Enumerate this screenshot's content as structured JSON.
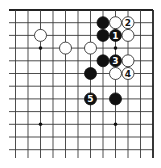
{
  "diagram": {
    "type": "go-board-fragment",
    "corner": "top-right",
    "grid": {
      "columns": 12,
      "rows": 12,
      "right_edge_x": 153,
      "top_edge_y": 10,
      "spacing_x": 12.5,
      "spacing_y": 12.7,
      "left_line_start_x": 9,
      "bottom_line_end_y": 158
    },
    "colors": {
      "line": "#3a3a3a",
      "edge": "#222222",
      "black_stone": "#111111",
      "white_stone": "#ffffff",
      "white_outline": "#333333"
    },
    "star_points": [
      {
        "col": 3,
        "row": 3
      },
      {
        "col": 9,
        "row": 3
      },
      {
        "col": 3,
        "row": 9
      },
      {
        "col": 9,
        "row": 9
      }
    ],
    "stones": [
      {
        "color": "black",
        "col": 4,
        "row": 1,
        "label": ""
      },
      {
        "color": "white",
        "col": 3,
        "row": 1,
        "label": ""
      },
      {
        "color": "white",
        "col": 2,
        "row": 1,
        "label": "2"
      },
      {
        "color": "black",
        "col": 4,
        "row": 2,
        "label": ""
      },
      {
        "color": "black",
        "col": 3,
        "row": 2,
        "label": "1"
      },
      {
        "color": "white",
        "col": 2,
        "row": 2,
        "label": ""
      },
      {
        "color": "white",
        "col": 9,
        "row": 2,
        "label": ""
      },
      {
        "color": "white",
        "col": 7,
        "row": 3,
        "label": ""
      },
      {
        "color": "white",
        "col": 5,
        "row": 3,
        "label": ""
      },
      {
        "color": "black",
        "col": 4,
        "row": 4,
        "label": ""
      },
      {
        "color": "black",
        "col": 3,
        "row": 4,
        "label": "3"
      },
      {
        "color": "white",
        "col": 2,
        "row": 4,
        "label": ""
      },
      {
        "color": "black",
        "col": 5,
        "row": 5,
        "label": ""
      },
      {
        "color": "white",
        "col": 3,
        "row": 5,
        "label": ""
      },
      {
        "color": "white",
        "col": 2,
        "row": 5,
        "label": "4"
      },
      {
        "color": "black",
        "col": 5,
        "row": 7,
        "label": "5"
      },
      {
        "color": "black",
        "col": 3,
        "row": 7,
        "label": ""
      }
    ],
    "stone_radius": 6
  }
}
